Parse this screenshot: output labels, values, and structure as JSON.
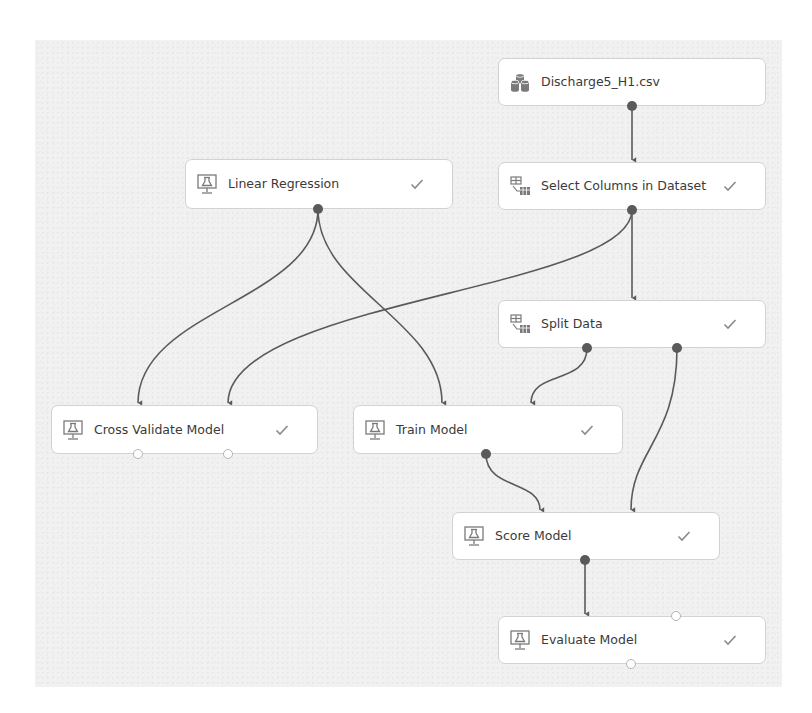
{
  "canvas": {
    "background": "#f1f1f1",
    "edge_color": "#5a5a5a",
    "node_border": "#d2d2d2"
  },
  "nodes": [
    {
      "id": "dataset",
      "label": "Discharge5_H1.csv",
      "icon": "dataset-icon",
      "status": "",
      "x": 498,
      "y": 58,
      "w": 268,
      "h": 48
    },
    {
      "id": "select-columns",
      "label": "Select Columns in Dataset",
      "icon": "data-transform-icon",
      "status": "completed",
      "x": 498,
      "y": 162,
      "w": 268,
      "h": 48
    },
    {
      "id": "linear-regression",
      "label": "Linear Regression",
      "icon": "ml-module-icon",
      "status": "completed",
      "x": 185,
      "y": 159,
      "w": 268,
      "h": 50
    },
    {
      "id": "split-data",
      "label": "Split Data",
      "icon": "data-transform-icon",
      "status": "completed",
      "x": 498,
      "y": 300,
      "w": 268,
      "h": 48
    },
    {
      "id": "cross-validate",
      "label": "Cross Validate Model",
      "icon": "ml-module-icon",
      "status": "completed",
      "x": 51,
      "y": 405,
      "w": 267,
      "h": 49
    },
    {
      "id": "train-model",
      "label": "Train Model",
      "icon": "ml-module-icon",
      "status": "completed",
      "x": 353,
      "y": 405,
      "w": 270,
      "h": 49
    },
    {
      "id": "score-model",
      "label": "Score Model",
      "icon": "ml-module-icon",
      "status": "completed",
      "x": 452,
      "y": 512,
      "w": 268,
      "h": 48
    },
    {
      "id": "evaluate-model",
      "label": "Evaluate Model",
      "icon": "ml-module-icon",
      "status": "completed",
      "x": 498,
      "y": 616,
      "w": 268,
      "h": 48
    }
  ],
  "edges": [
    {
      "from": "dataset",
      "to": "select-columns"
    },
    {
      "from": "linear-regression",
      "to": "cross-validate"
    },
    {
      "from": "linear-regression",
      "to": "train-model"
    },
    {
      "from": "select-columns",
      "to": "cross-validate"
    },
    {
      "from": "select-columns",
      "to": "split-data"
    },
    {
      "from": "split-data",
      "to": "train-model"
    },
    {
      "from": "split-data",
      "to": "score-model"
    },
    {
      "from": "train-model",
      "to": "score-model"
    },
    {
      "from": "score-model",
      "to": "evaluate-model"
    }
  ]
}
